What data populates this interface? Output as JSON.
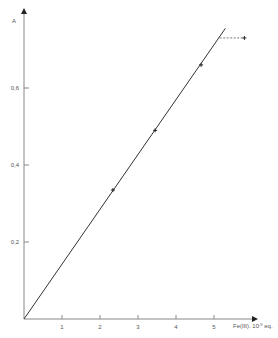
{
  "chart_data": {
    "type": "line",
    "title": "",
    "xlabel": "Fe(III). 10^-9 eq.",
    "xlabel_main": "Fe(III). 10",
    "xlabel_sup": "-9",
    "xlabel_tail": " eq.",
    "ylabel": "A",
    "xlim": [
      0,
      6
    ],
    "ylim": [
      0,
      0.75
    ],
    "x_ticks": [
      1,
      2,
      3,
      4,
      5
    ],
    "x_tick_labels": [
      "1",
      "2",
      "3",
      "4",
      "5"
    ],
    "y_ticks": [
      0.2,
      0.4,
      0.6
    ],
    "y_tick_labels": [
      "0,2",
      "0,4",
      "0,6"
    ],
    "grid": false,
    "legend": null,
    "series": [
      {
        "name": "calibration line",
        "style": "solid",
        "points": [
          [
            0,
            0
          ],
          [
            5.3,
            0.755
          ]
        ]
      },
      {
        "name": "measured points",
        "style": "markers",
        "points": [
          [
            2.34,
            0.335
          ],
          [
            3.45,
            0.49
          ],
          [
            4.66,
            0.66
          ],
          [
            5.8,
            0.73
          ]
        ]
      },
      {
        "name": "plateau",
        "style": "dashed",
        "points": [
          [
            5.15,
            0.73
          ],
          [
            5.8,
            0.73
          ]
        ]
      }
    ]
  }
}
